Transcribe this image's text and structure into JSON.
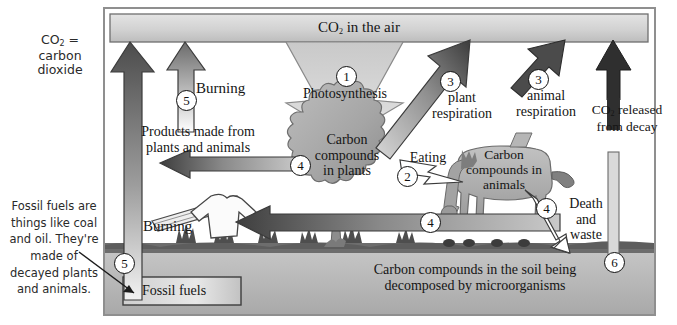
{
  "diagram": {
    "legend": {
      "line1": "CO2 =",
      "line2": "carbon dioxide"
    },
    "fossil_note": "Fossil fuels are things like coal and oil.  They're made of decayed plants and animals.",
    "atmosphere_label": "CO2 in the air",
    "photosynthesis_label": "Photosynthesis",
    "plants_label": "Carbon compounds in plants",
    "animals_label": "Carbon compounds in animals",
    "soil_label": "Carbon compounds in the soil being decomposed by microorganisms",
    "fossil_fuels_label": "Fossil fuels",
    "burning_top_label": "Burning",
    "burning_left_label": "Burning",
    "products_label": "Products made from plants and animals",
    "plant_respiration_label": "plant respiration",
    "animal_respiration_label": "animal respiration",
    "decay_label": "CO2 released from decay",
    "eating_label": "Eating",
    "death_waste_label": "Death and waste",
    "numbers": {
      "photosynthesis": "1",
      "eating": "2",
      "plant_respiration": "3",
      "animal_respiration": "3",
      "products": "4",
      "burning_products": "4",
      "animals_to_soil": "4",
      "death_waste": "4",
      "burning_top": "5",
      "burning_fossil": "5",
      "decay": "6"
    },
    "colors": {
      "frame": "#9a9a9a",
      "band": "#d3d3d3",
      "plant": "#a8a8a8",
      "animal": "#b0b0b0",
      "soil": "#b7b7b7",
      "grass": "#5d5d5d",
      "dark_arrow": "#4a4a4a",
      "black_arrow": "#2b2b2b",
      "white_arrow": "#ffffff",
      "text": "#151515"
    }
  }
}
